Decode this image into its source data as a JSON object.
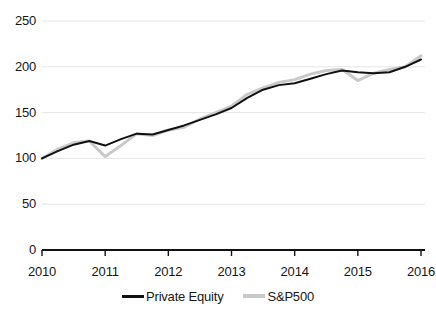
{
  "chart_data": {
    "type": "line",
    "title": "",
    "subtitle": "",
    "xlabel": "",
    "ylabel": "",
    "xlim": [
      2010,
      2016
    ],
    "ylim": [
      0,
      250
    ],
    "grid": true,
    "grid_axis": "y",
    "legend_position": "bottom-center",
    "y_ticks": [
      0,
      50,
      100,
      150,
      200,
      250
    ],
    "y_tick_labels": [
      "0",
      "50",
      "100",
      "150",
      "200",
      "250"
    ],
    "x_ticks": [
      2010,
      2011,
      2012,
      2013,
      2014,
      2015,
      2016
    ],
    "x_tick_labels": [
      "2010",
      "2011",
      "2012",
      "2013",
      "2014",
      "2015",
      "2016"
    ],
    "x": [
      2010.0,
      2010.25,
      2010.5,
      2010.75,
      2011.0,
      2011.25,
      2011.5,
      2011.75,
      2012.0,
      2012.25,
      2012.5,
      2012.75,
      2013.0,
      2013.25,
      2013.5,
      2013.75,
      2014.0,
      2014.25,
      2014.5,
      2014.75,
      2015.0,
      2015.25,
      2015.5,
      2015.75,
      2016.0
    ],
    "series": [
      {
        "name": "Private Equity",
        "color": "#111111",
        "width": 2.0,
        "values": [
          100,
          108,
          115,
          119,
          114,
          121,
          127,
          126,
          131,
          136,
          142,
          148,
          155,
          166,
          175,
          180,
          182,
          187,
          192,
          196,
          194,
          193,
          194,
          200,
          208
        ]
      },
      {
        "name": "S&P500",
        "color": "#c9c9c9",
        "width": 3.0,
        "values": [
          100,
          110,
          117,
          119,
          102,
          114,
          127,
          125,
          131,
          134,
          143,
          150,
          157,
          170,
          177,
          183,
          186,
          192,
          196,
          197,
          185,
          193,
          197,
          200,
          212
        ]
      }
    ],
    "annotations": []
  },
  "legend": {
    "items": [
      {
        "label": "Private Equity",
        "color": "#111111",
        "swatch": "line-swatch-dark"
      },
      {
        "label": "S&P500",
        "color": "#c9c9c9",
        "swatch": "line-swatch-light"
      }
    ]
  },
  "axes": {
    "x_axis_color": "#111111",
    "grid_color": "#e6e6e6",
    "tick_color": "#111111"
  }
}
